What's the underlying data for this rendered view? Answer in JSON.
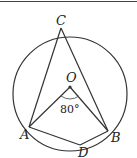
{
  "diagram": {
    "type": "circle-geometry",
    "colors": {
      "stroke": "#333333",
      "background": "#ffffff"
    },
    "circle": {
      "center": "O",
      "cx": 70,
      "cy": 94,
      "r": 57
    },
    "points": {
      "C": {
        "label": "C",
        "x": 61,
        "y": 28
      },
      "O": {
        "label": "O",
        "x": 70,
        "y": 87
      },
      "A": {
        "label": "A",
        "x": 29,
        "y": 127
      },
      "B": {
        "label": "B",
        "x": 108,
        "y": 131
      },
      "D": {
        "label": "D",
        "x": 80,
        "y": 145
      }
    },
    "angle": {
      "vertex": "O",
      "between": [
        "A",
        "B"
      ],
      "label": "80°"
    },
    "segments": [
      "CA",
      "CB",
      "OA",
      "OB",
      "AD",
      "DB",
      "AB"
    ]
  }
}
